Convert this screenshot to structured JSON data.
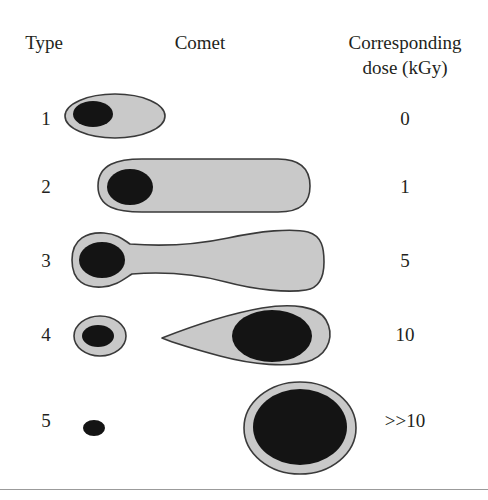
{
  "figure": {
    "title_columns": {
      "type": "Type",
      "comet": "Comet",
      "dose": "Corresponding\ndose (kGy)"
    },
    "style": {
      "comet_fill": "#c9c9c9",
      "comet_stroke": "#3a3a3a",
      "nucleus_fill": "#141414",
      "text_color": "#231f20",
      "background": "#ffffff",
      "rule_color": "#8a8a8a"
    },
    "rows": [
      {
        "type": "1",
        "dose": "0",
        "shape_name": "oval-comet-no-tail",
        "description": "Rounded oval nucleoid with dark nucleus at left, no tail"
      },
      {
        "type": "2",
        "dose": "1",
        "shape_name": "capsule-comet-short-tail",
        "description": "Elongated capsule with dark nucleus at left and broad even tail"
      },
      {
        "type": "3",
        "dose": "5",
        "shape_name": "flared-comet-wide-tail",
        "description": "Narrow head with dark nucleus, tail flaring wider toward the right"
      },
      {
        "type": "4",
        "dose": "10",
        "shape_name": "teardrop-comet-migrated-nucleus",
        "description": "Small empty head circle plus separate teardrop with large dark nucleus shifted into the tail"
      },
      {
        "type": "5",
        "dose": ">>10",
        "shape_name": "detached-nucleus-full-comet",
        "description": "Tiny residual dark dot plus a large round comet almost entirely filled with dark DNA"
      }
    ]
  }
}
